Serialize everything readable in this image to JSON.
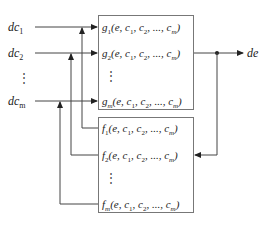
{
  "diagram": {
    "type": "block-diagram",
    "inputs": [
      {
        "base": "dc",
        "sub": "1"
      },
      {
        "base": "dc",
        "sub": "2"
      },
      {
        "base": "⋮",
        "sub": ""
      },
      {
        "base": "dc",
        "sub": "m"
      }
    ],
    "output": {
      "label": "de"
    },
    "g_block": {
      "rows": [
        {
          "fn": "g",
          "sub": "1",
          "args": "(e, c",
          "a1": "1",
          "mid": ", c",
          "a2": "2",
          "tail": ", ..., c",
          "am": "m",
          "close": ")"
        },
        {
          "fn": "g",
          "sub": "2",
          "args": "(e, c",
          "a1": "1",
          "mid": ", c",
          "a2": "2",
          "tail": ", ..., c",
          "am": "m",
          "close": ")"
        },
        {
          "fn": "g",
          "sub": "m",
          "args": "(e, c",
          "a1": "1",
          "mid": ", c",
          "a2": "2",
          "tail": ", ..., c",
          "am": "m",
          "close": ")"
        }
      ],
      "ellipsis": "⋮"
    },
    "f_block": {
      "rows": [
        {
          "fn": "f",
          "sub": "1",
          "args": "(e, c",
          "a1": "1",
          "mid": ", c",
          "a2": "2",
          "tail": ", ..., c",
          "am": "m",
          "close": ")"
        },
        {
          "fn": "f",
          "sub": "2",
          "args": "(e, c",
          "a1": "1",
          "mid": ", c",
          "a2": "2",
          "tail": ", ..., c",
          "am": "m",
          "close": ")"
        },
        {
          "fn": "f",
          "sub": "m",
          "args": "(e, c",
          "a1": "1",
          "mid": ", c",
          "a2": "2",
          "tail": ", ..., c",
          "am": "m",
          "close": ")"
        }
      ],
      "ellipsis": "⋮"
    },
    "colors": {
      "line": "#444444",
      "box_border": "#777777",
      "text": "#222222"
    }
  }
}
